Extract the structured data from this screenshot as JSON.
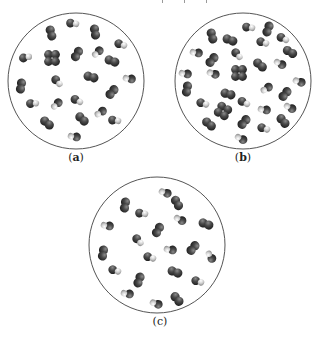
{
  "figure": {
    "panels": [
      {
        "id": "a",
        "label_open": "(",
        "label_letter": "a",
        "label_close": ")",
        "label_bold": true,
        "circle": {
          "cx": 76,
          "cy": 81,
          "r": 68
        },
        "label_pos": {
          "x": 61,
          "y": 151
        },
        "molecules": [
          {
            "x": 73,
            "y": 24,
            "type": "hetero",
            "angle": 20
          },
          {
            "x": 51,
            "y": 33,
            "type": "diatomic",
            "angle": 75
          },
          {
            "x": 95,
            "y": 32,
            "type": "diatomic",
            "angle": 80
          },
          {
            "x": 121,
            "y": 45,
            "type": "hetero",
            "angle": 30
          },
          {
            "x": 26,
            "y": 58,
            "type": "hetero",
            "angle": 0
          },
          {
            "x": 52,
            "y": 58,
            "type": "cluster",
            "angle": 0
          },
          {
            "x": 77,
            "y": 54,
            "type": "diatomic",
            "angle": 120
          },
          {
            "x": 97,
            "y": 52,
            "type": "hetero",
            "angle": 150
          },
          {
            "x": 112,
            "y": 61,
            "type": "diatomic",
            "angle": 20
          },
          {
            "x": 91,
            "y": 77,
            "type": "diatomic",
            "angle": 15
          },
          {
            "x": 129,
            "y": 78,
            "type": "hetero",
            "angle": 200
          },
          {
            "x": 21,
            "y": 86,
            "type": "diatomic",
            "angle": 100
          },
          {
            "x": 57,
            "y": 82,
            "type": "hetero",
            "angle": 60
          },
          {
            "x": 112,
            "y": 92,
            "type": "diatomic",
            "angle": 130
          },
          {
            "x": 33,
            "y": 104,
            "type": "hetero",
            "angle": 10
          },
          {
            "x": 56,
            "y": 104,
            "type": "hetero",
            "angle": 150
          },
          {
            "x": 77,
            "y": 101,
            "type": "hetero",
            "angle": 40
          },
          {
            "x": 100,
            "y": 112,
            "type": "hetero",
            "angle": 160
          },
          {
            "x": 47,
            "y": 123,
            "type": "diatomic",
            "angle": 40
          },
          {
            "x": 82,
            "y": 119,
            "type": "diatomic",
            "angle": 45
          },
          {
            "x": 115,
            "y": 121,
            "type": "hetero",
            "angle": 20
          },
          {
            "x": 74,
            "y": 136,
            "type": "hetero",
            "angle": 200
          }
        ]
      },
      {
        "id": "b",
        "label_open": "(",
        "label_letter": "b",
        "label_close": ")",
        "label_bold": true,
        "circle": {
          "cx": 243,
          "cy": 81,
          "r": 68
        },
        "label_pos": {
          "x": 228,
          "y": 151
        },
        "molecules": [
          {
            "x": 249,
            "y": 28,
            "type": "hetero",
            "angle": 20
          },
          {
            "x": 268,
            "y": 29,
            "type": "diatomic",
            "angle": 110
          },
          {
            "x": 212,
            "y": 36,
            "type": "diatomic",
            "angle": 75
          },
          {
            "x": 230,
            "y": 40,
            "type": "diatomic",
            "angle": 20
          },
          {
            "x": 263,
            "y": 43,
            "type": "hetero",
            "angle": 30
          },
          {
            "x": 283,
            "y": 39,
            "type": "hetero",
            "angle": 40
          },
          {
            "x": 196,
            "y": 52,
            "type": "hetero",
            "angle": 200
          },
          {
            "x": 237,
            "y": 55,
            "type": "hetero",
            "angle": 60
          },
          {
            "x": 290,
            "y": 52,
            "type": "diatomic",
            "angle": 30
          },
          {
            "x": 212,
            "y": 60,
            "type": "diatomic",
            "angle": 130
          },
          {
            "x": 260,
            "y": 65,
            "type": "diatomic",
            "angle": 40
          },
          {
            "x": 280,
            "y": 63,
            "type": "hetero",
            "angle": 220
          },
          {
            "x": 239,
            "y": 73,
            "type": "cluster",
            "angle": 0
          },
          {
            "x": 185,
            "y": 73,
            "type": "hetero",
            "angle": 200
          },
          {
            "x": 213,
            "y": 73,
            "type": "hetero",
            "angle": 210
          },
          {
            "x": 299,
            "y": 81,
            "type": "hetero",
            "angle": 210
          },
          {
            "x": 187,
            "y": 89,
            "type": "diatomic",
            "angle": 100
          },
          {
            "x": 266,
            "y": 88,
            "type": "hetero",
            "angle": 160
          },
          {
            "x": 228,
            "y": 94,
            "type": "diatomic",
            "angle": 15
          },
          {
            "x": 285,
            "y": 94,
            "type": "diatomic",
            "angle": 130
          },
          {
            "x": 203,
            "y": 104,
            "type": "hetero",
            "angle": 30
          },
          {
            "x": 223,
            "y": 111,
            "type": "cluster",
            "angle": 30
          },
          {
            "x": 244,
            "y": 103,
            "type": "hetero",
            "angle": 40
          },
          {
            "x": 264,
            "y": 109,
            "type": "hetero",
            "angle": 200
          },
          {
            "x": 290,
            "y": 107,
            "type": "hetero",
            "angle": 220
          },
          {
            "x": 209,
            "y": 124,
            "type": "diatomic",
            "angle": 40
          },
          {
            "x": 244,
            "y": 122,
            "type": "diatomic",
            "angle": 130
          },
          {
            "x": 283,
            "y": 121,
            "type": "diatomic",
            "angle": 50
          },
          {
            "x": 264,
            "y": 129,
            "type": "hetero",
            "angle": 30
          },
          {
            "x": 241,
            "y": 138,
            "type": "hetero",
            "angle": 220
          }
        ]
      },
      {
        "id": "c",
        "label_open": "(",
        "label_letter": "c",
        "label_close": ")",
        "label_bold": false,
        "circle": {
          "cx": 157,
          "cy": 245,
          "r": 68
        },
        "label_pos": {
          "x": 145,
          "y": 315
        },
        "molecules": [
          {
            "x": 165,
            "y": 192,
            "type": "hetero",
            "angle": 210
          },
          {
            "x": 177,
            "y": 203,
            "type": "diatomic",
            "angle": 60
          },
          {
            "x": 125,
            "y": 205,
            "type": "diatomic",
            "angle": 100
          },
          {
            "x": 142,
            "y": 214,
            "type": "hetero",
            "angle": 20
          },
          {
            "x": 180,
            "y": 219,
            "type": "hetero",
            "angle": 220
          },
          {
            "x": 206,
            "y": 224,
            "type": "diatomic",
            "angle": 20
          },
          {
            "x": 107,
            "y": 225,
            "type": "hetero",
            "angle": 200
          },
          {
            "x": 158,
            "y": 230,
            "type": "diatomic",
            "angle": 120
          },
          {
            "x": 138,
            "y": 241,
            "type": "hetero",
            "angle": 60
          },
          {
            "x": 170,
            "y": 249,
            "type": "hetero",
            "angle": 200
          },
          {
            "x": 193,
            "y": 248,
            "type": "diatomic",
            "angle": 130
          },
          {
            "x": 211,
            "y": 256,
            "type": "hetero",
            "angle": 250
          },
          {
            "x": 103,
            "y": 253,
            "type": "diatomic",
            "angle": 100
          },
          {
            "x": 150,
            "y": 258,
            "type": "hetero",
            "angle": 30
          },
          {
            "x": 115,
            "y": 271,
            "type": "hetero",
            "angle": 30
          },
          {
            "x": 175,
            "y": 272,
            "type": "diatomic",
            "angle": 20
          },
          {
            "x": 139,
            "y": 280,
            "type": "diatomic",
            "angle": 110
          },
          {
            "x": 198,
            "y": 282,
            "type": "hetero",
            "angle": 30
          },
          {
            "x": 127,
            "y": 293,
            "type": "hetero",
            "angle": 200
          },
          {
            "x": 156,
            "y": 303,
            "type": "hetero",
            "angle": 210
          },
          {
            "x": 177,
            "y": 299,
            "type": "diatomic",
            "angle": 50
          }
        ]
      }
    ],
    "colors": {
      "background": "#ffffff",
      "circle_stroke": "#555555",
      "atom_dark": "#3a3a3a",
      "atom_mid": "#6a6a6a",
      "atom_light": "#d8d8d8",
      "label_text": "#222222"
    }
  }
}
